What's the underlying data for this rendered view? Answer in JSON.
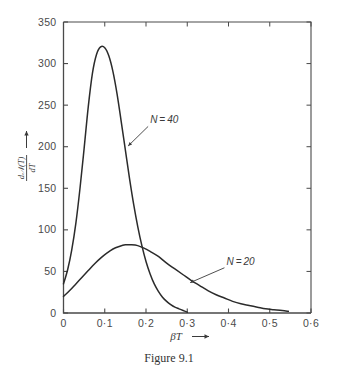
{
  "figure": {
    "caption": "Figure 9.1"
  },
  "chart_data": {
    "type": "line",
    "title": "",
    "xlabel": "βT",
    "xlabel_arrow": "→",
    "ylabel_numerator": "d𝒩(T)",
    "ylabel_denominator": "dT",
    "ylabel_arrow": "↑",
    "xlim": [
      0,
      0.6
    ],
    "ylim": [
      0,
      350
    ],
    "grid": false,
    "legend_position": "inline-annotations",
    "xticks": [
      0,
      0.1,
      0.2,
      0.3,
      0.4,
      0.5,
      0.6
    ],
    "xtick_labels": [
      "0",
      "0·1",
      "0·2",
      "0·3",
      "0·4",
      "0·5",
      "0·6"
    ],
    "yticks": [
      0,
      50,
      100,
      150,
      200,
      250,
      300,
      350
    ],
    "ytick_labels": [
      "0",
      "50",
      "100",
      "150",
      "200",
      "250",
      "300",
      "350"
    ],
    "series": [
      {
        "name": "N = 40",
        "label": "N = 40",
        "color": "#2b2b2b",
        "peak_x": 0.1,
        "peak_y": 320,
        "x": [
          0.0,
          0.01,
          0.02,
          0.03,
          0.04,
          0.05,
          0.06,
          0.07,
          0.08,
          0.09,
          0.1,
          0.11,
          0.12,
          0.13,
          0.14,
          0.15,
          0.16,
          0.17,
          0.18,
          0.19,
          0.2,
          0.21,
          0.22,
          0.23,
          0.24,
          0.25,
          0.26,
          0.27,
          0.28,
          0.29,
          0.3
        ],
        "y": [
          35,
          52,
          76,
          108,
          150,
          198,
          248,
          288,
          311,
          320,
          319,
          309,
          290,
          263,
          230,
          196,
          162,
          131,
          104,
          81,
          62,
          47,
          35,
          26,
          19,
          14,
          10,
          7,
          5,
          3,
          1
        ]
      },
      {
        "name": "N = 20",
        "label": "N = 20",
        "color": "#2b2b2b",
        "peak_x": 0.155,
        "peak_y": 82,
        "x": [
          0.0,
          0.015,
          0.03,
          0.045,
          0.06,
          0.075,
          0.09,
          0.105,
          0.12,
          0.135,
          0.15,
          0.165,
          0.18,
          0.195,
          0.21,
          0.23,
          0.25,
          0.27,
          0.29,
          0.31,
          0.33,
          0.35,
          0.37,
          0.39,
          0.41,
          0.43,
          0.45,
          0.47,
          0.49,
          0.51,
          0.53,
          0.545
        ],
        "y": [
          20,
          27,
          35,
          43,
          51,
          59,
          66,
          72,
          77,
          80,
          82,
          82,
          81,
          78,
          74,
          68,
          60,
          53,
          46,
          39,
          33,
          27,
          22,
          18,
          14,
          11,
          9,
          7,
          5,
          4,
          3,
          2
        ]
      }
    ],
    "annotations": [
      {
        "text": "N = 40",
        "target_x": 0.155,
        "target_y": 200,
        "label_x": 0.21,
        "label_y": 228
      },
      {
        "text": "N = 20",
        "target_x": 0.305,
        "target_y": 36,
        "label_x": 0.395,
        "label_y": 58
      }
    ]
  }
}
